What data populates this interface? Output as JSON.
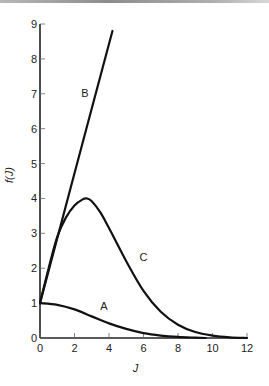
{
  "chart_data": {
    "type": "line",
    "title": "",
    "xlabel": "J",
    "ylabel": "f(J)",
    "xlim": [
      0,
      12
    ],
    "ylim": [
      0,
      9
    ],
    "xticks": [
      0,
      2,
      4,
      6,
      8,
      10,
      12
    ],
    "yticks": [
      0,
      1,
      2,
      3,
      4,
      5,
      6,
      7,
      8,
      9
    ],
    "grid": false,
    "legend": "none",
    "series": [
      {
        "name": "A",
        "x": [
          0,
          1,
          2,
          3,
          4,
          5,
          6,
          7,
          8,
          9,
          9.6
        ],
        "y": [
          1.0,
          0.95,
          0.82,
          0.62,
          0.42,
          0.26,
          0.14,
          0.07,
          0.03,
          0.01,
          0.0
        ],
        "label_at": [
          3.7,
          0.8
        ]
      },
      {
        "name": "B",
        "x": [
          0,
          1,
          2,
          3,
          4.2
        ],
        "y": [
          1.0,
          2.86,
          4.72,
          6.58,
          8.8
        ],
        "label_at": [
          2.6,
          6.9
        ]
      },
      {
        "name": "C",
        "x": [
          0,
          0.5,
          1,
          1.5,
          2,
          2.5,
          2.7,
          3,
          3.5,
          4,
          5,
          6,
          7,
          8,
          9,
          10,
          11,
          12
        ],
        "y": [
          1.0,
          2.0,
          2.9,
          3.45,
          3.8,
          3.98,
          4.0,
          3.92,
          3.6,
          3.15,
          2.2,
          1.35,
          0.75,
          0.38,
          0.17,
          0.07,
          0.02,
          0.0
        ],
        "label_at": [
          6.0,
          2.2
        ]
      }
    ]
  }
}
